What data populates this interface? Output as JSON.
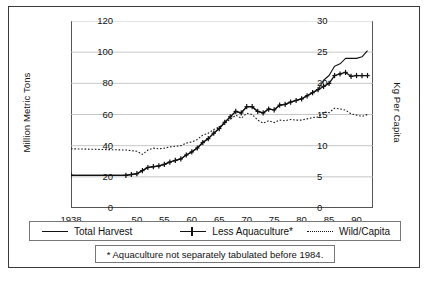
{
  "axes": {
    "y_left_title": "Million Metric Tons",
    "y_right_title": "Kg Per Capita",
    "y_left_ticks": [
      "0",
      "20",
      "40",
      "60",
      "80",
      "100",
      "120"
    ],
    "y_right_ticks": [
      "0",
      "5",
      "10",
      "15",
      "20",
      "25",
      "30"
    ],
    "x_ticks": [
      "1938",
      "50",
      "55",
      "60",
      "65",
      "70",
      "75",
      "80",
      "85",
      "90"
    ]
  },
  "legend": {
    "items": [
      {
        "label": "Total Harvest",
        "style": "solid"
      },
      {
        "label": "Less Aquaculture*",
        "style": "marker"
      },
      {
        "label": "Wild/Capita",
        "style": "dotted"
      }
    ]
  },
  "footnote": {
    "text": "* Aquaculture not separately tabulated before 1984."
  },
  "chart_data": {
    "type": "line",
    "title": "",
    "xlabel": "",
    "ylabel": "Million Metric Tons",
    "y2label": "Kg Per Capita",
    "xlim": [
      1938,
      1993
    ],
    "ylim": [
      0,
      120
    ],
    "y2lim": [
      0,
      30
    ],
    "grid": "horizontal",
    "legend_position": "below-plot",
    "x_tick_values": [
      1938,
      1950,
      1955,
      1960,
      1965,
      1970,
      1975,
      1980,
      1985,
      1990
    ],
    "series": [
      {
        "name": "Total Harvest",
        "axis": "left",
        "units": "Million Metric Tons",
        "style": "solid",
        "x": [
          1938,
          1948,
          1949,
          1950,
          1951,
          1952,
          1953,
          1954,
          1955,
          1956,
          1957,
          1958,
          1959,
          1960,
          1961,
          1962,
          1963,
          1964,
          1965,
          1966,
          1967,
          1968,
          1969,
          1970,
          1971,
          1972,
          1973,
          1974,
          1975,
          1976,
          1977,
          1978,
          1979,
          1980,
          1981,
          1982,
          1983,
          1984,
          1985,
          1986,
          1987,
          1988,
          1989,
          1990,
          1991,
          1992
        ],
        "y": [
          21,
          21,
          21.5,
          22,
          24,
          26,
          26.5,
          27,
          28,
          29.5,
          30.5,
          31.5,
          34,
          36,
          38.5,
          42,
          44.5,
          48,
          51,
          55,
          58.5,
          62,
          61,
          65,
          65,
          62,
          61,
          63.5,
          63,
          66,
          66.5,
          68,
          69,
          70,
          72,
          74,
          76,
          82,
          85,
          91,
          92.5,
          96,
          96,
          96,
          97,
          101
        ]
      },
      {
        "name": "Less Aquaculture*",
        "axis": "left",
        "units": "Million Metric Tons",
        "style": "line-with-plus-markers",
        "x": [
          1938,
          1948,
          1949,
          1950,
          1951,
          1952,
          1953,
          1954,
          1955,
          1956,
          1957,
          1958,
          1959,
          1960,
          1961,
          1962,
          1963,
          1964,
          1965,
          1966,
          1967,
          1968,
          1969,
          1970,
          1971,
          1972,
          1973,
          1974,
          1975,
          1976,
          1977,
          1978,
          1979,
          1980,
          1981,
          1982,
          1983,
          1984,
          1985,
          1986,
          1987,
          1988,
          1989,
          1990,
          1991,
          1992
        ],
        "y": [
          21,
          21,
          21.5,
          22,
          24,
          26,
          26.5,
          27,
          28,
          29.5,
          30.5,
          31.5,
          34,
          36,
          38.5,
          42,
          44.5,
          48,
          51,
          55,
          58.5,
          62,
          61,
          65,
          65,
          62,
          61,
          63.5,
          63,
          66,
          66.5,
          68,
          69,
          70,
          72,
          74,
          76,
          78,
          80,
          85,
          86,
          87,
          84.5,
          85,
          85,
          85
        ]
      },
      {
        "name": "Wild/Capita",
        "axis": "right",
        "units": "Kg Per Capita",
        "style": "dotted",
        "x": [
          1938,
          1948,
          1949,
          1950,
          1951,
          1952,
          1953,
          1954,
          1955,
          1956,
          1957,
          1958,
          1959,
          1960,
          1961,
          1962,
          1963,
          1964,
          1965,
          1966,
          1967,
          1968,
          1969,
          1970,
          1971,
          1972,
          1973,
          1974,
          1975,
          1976,
          1977,
          1978,
          1979,
          1980,
          1981,
          1982,
          1983,
          1984,
          1985,
          1986,
          1987,
          1988,
          1989,
          1990,
          1991,
          1992
        ],
        "y": [
          9.5,
          9.3,
          9.2,
          9.1,
          8.6,
          9.3,
          9.6,
          9.5,
          9.6,
          9.8,
          9.9,
          10.0,
          10.4,
          10.6,
          11.0,
          11.7,
          12.0,
          12.6,
          13.0,
          13.7,
          14.2,
          14.9,
          14.4,
          15.2,
          15.0,
          14.1,
          13.6,
          14.0,
          13.7,
          14.1,
          14.0,
          14.2,
          14.1,
          14.1,
          14.3,
          14.5,
          14.6,
          15.4,
          15.3,
          16.0,
          15.9,
          15.7,
          15.1,
          14.9,
          14.7,
          15.0
        ]
      }
    ]
  }
}
